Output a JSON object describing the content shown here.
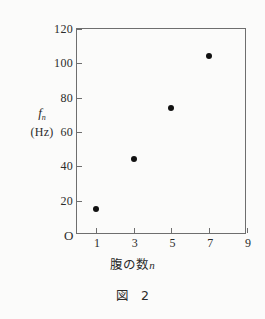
{
  "figure": {
    "caption_label": "図",
    "caption_number": "2"
  },
  "chart_data": {
    "type": "scatter",
    "title": "",
    "xlabel": "腹の数 n",
    "xlabel_text": "腹の数",
    "xlabel_symbol": "n",
    "ylabel": "f_n (Hz)",
    "ylabel_symbol": "f",
    "ylabel_subscript": "n",
    "ylabel_unit": "(Hz)",
    "origin_label": "O",
    "x": [
      1,
      3,
      5,
      7
    ],
    "values": [
      15,
      44,
      74,
      104
    ],
    "points": [
      {
        "x": 1,
        "y": 15
      },
      {
        "x": 3,
        "y": 44
      },
      {
        "x": 5,
        "y": 74
      },
      {
        "x": 7,
        "y": 104
      }
    ],
    "xlim": [
      0,
      9
    ],
    "ylim": [
      0,
      120
    ],
    "xticks": [
      1,
      3,
      5,
      7,
      9
    ],
    "xtick_labels": [
      "1",
      "3",
      "5",
      "7",
      "9"
    ],
    "yticks": [
      20,
      40,
      60,
      80,
      100,
      120
    ],
    "ytick_labels": [
      "20",
      "40",
      "60",
      "80",
      "100",
      "120"
    ],
    "grid": false,
    "legend": null,
    "marker_color": "#111111",
    "axis_color": "#6e6e6e",
    "background_color": "#fbfbfa"
  }
}
